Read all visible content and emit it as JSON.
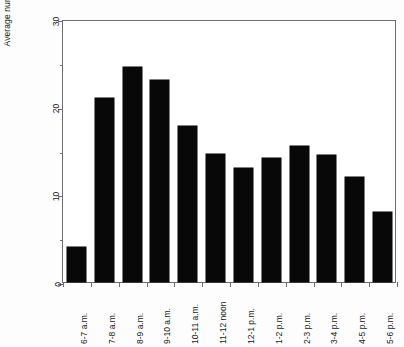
{
  "chart_data": {
    "type": "bar",
    "title": "",
    "xlabel": "",
    "ylabel": "Average number of patients",
    "ylim": [
      0,
      30
    ],
    "yticks": [
      0,
      10,
      20,
      30
    ],
    "yminorticks": [
      5,
      15,
      25
    ],
    "ytick_labels": [
      "0",
      "10",
      "20",
      "30"
    ],
    "grid": false,
    "legend": false,
    "bar_color": "#080808",
    "axis_color": "#6f6f6f",
    "categories": [
      "6-7 a.m.",
      "7-8 a.m.",
      "8-9 a.m.",
      "9-10 a.m.",
      "10-11 a.m.",
      "11-12 noon",
      "12-1 p.m.",
      "1-2 p.m.",
      "2-3 p.m.",
      "3-4 p.m.",
      "4-5 p.m.",
      "5-6 p.m."
    ],
    "values": [
      4,
      21,
      24.5,
      23,
      17.8,
      14.6,
      13,
      14.2,
      15.5,
      14.5,
      12,
      8
    ]
  }
}
